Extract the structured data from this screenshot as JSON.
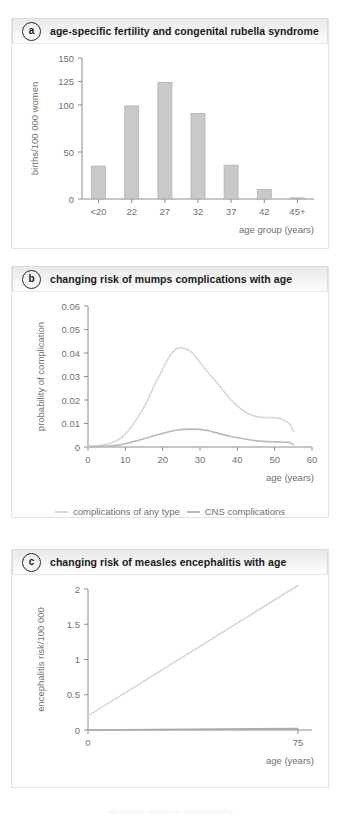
{
  "figure": {
    "footnote": "age-related changes in transmissibility"
  },
  "colors": {
    "bar_fill": "#c9c9c9",
    "bar_stroke": "#b2b2b2",
    "axis": "#8d8e90",
    "tick_text": "#6f7072",
    "curve_any": "#d8d8d8",
    "curve_cns": "#b9babc",
    "line_encephalitis": "#d8d8d8",
    "line_baseline": "#a9aaac",
    "header_text": "#1a1a1a"
  },
  "panels": [
    {
      "letter": "a",
      "title": "age-specific fertility and congenital rubella syndrome"
    },
    {
      "letter": "b",
      "title": "changing risk of mumps complications with age"
    },
    {
      "letter": "c",
      "title": "changing risk of measles encephalitis with age"
    }
  ],
  "legend_b": [
    {
      "label": "complications of any type",
      "color": "#d8d8d8"
    },
    {
      "label": "CNS complications",
      "color": "#b9babc"
    }
  ],
  "chart_data": [
    {
      "type": "bar",
      "panel": "a",
      "title": "age-specific fertility and congenital rubella syndrome",
      "xlabel": "age group (years)",
      "ylabel": "births/100 000 women",
      "categories": [
        "<20",
        "22",
        "27",
        "32",
        "37",
        "42",
        "45+"
      ],
      "values": [
        35,
        99,
        124,
        91,
        36,
        10,
        1
      ],
      "ylim": [
        0,
        150
      ],
      "yticks": [
        0,
        50,
        100,
        125,
        150
      ],
      "ytick_labels": [
        "0",
        "50",
        "100",
        "125",
        "150"
      ],
      "grid": false,
      "legend": "none"
    },
    {
      "type": "line",
      "panel": "b",
      "title": "changing risk of mumps complications with age",
      "xlabel": "age (years)",
      "ylabel": "probability of complication",
      "xlim": [
        0,
        60
      ],
      "ylim": [
        0,
        0.06
      ],
      "xticks": [
        0,
        10,
        20,
        30,
        40,
        50,
        60
      ],
      "xtick_labels": [
        "0",
        "10",
        "20",
        "30",
        "40",
        "50",
        "60"
      ],
      "yticks": [
        0,
        0.01,
        0.02,
        0.03,
        0.04,
        0.05,
        0.06
      ],
      "ytick_labels": [
        "0",
        "0.01",
        "0.02",
        "0.03",
        "0.04",
        "0.05",
        "0.06"
      ],
      "grid": false,
      "legend": "bottom-center",
      "series": [
        {
          "name": "complications of any type",
          "color": "#d8d8d8",
          "x": [
            0,
            5,
            8,
            10,
            12,
            15,
            18,
            20,
            22,
            24,
            26,
            28,
            30,
            32,
            35,
            38,
            40,
            42,
            44,
            46,
            48,
            50,
            52,
            54,
            55
          ],
          "values": [
            0.0002,
            0.0012,
            0.003,
            0.0055,
            0.0095,
            0.017,
            0.027,
            0.033,
            0.039,
            0.042,
            0.0418,
            0.04,
            0.036,
            0.032,
            0.0265,
            0.0205,
            0.0175,
            0.015,
            0.0135,
            0.0127,
            0.0125,
            0.0125,
            0.0118,
            0.0098,
            0.0068
          ]
        },
        {
          "name": "CNS complications",
          "color": "#b9babc",
          "x": [
            0,
            5,
            8,
            10,
            12,
            15,
            18,
            20,
            22,
            24,
            26,
            28,
            30,
            32,
            35,
            38,
            40,
            42,
            44,
            46,
            48,
            50,
            52,
            54,
            55
          ],
          "values": [
            0.0001,
            0.0004,
            0.0008,
            0.0014,
            0.0022,
            0.0035,
            0.005,
            0.0058,
            0.0066,
            0.0072,
            0.0075,
            0.0076,
            0.0075,
            0.007,
            0.0058,
            0.0046,
            0.004,
            0.0034,
            0.0029,
            0.0025,
            0.0023,
            0.0022,
            0.0021,
            0.0019,
            0.001
          ]
        }
      ]
    },
    {
      "type": "line",
      "panel": "c",
      "title": "changing risk of measles encephalitis with age",
      "xlabel": "age (years)",
      "ylabel": "encephalitis risk/100 000",
      "xlim": [
        0,
        80
      ],
      "ylim": [
        0,
        2
      ],
      "xticks": [
        0,
        75
      ],
      "xtick_labels": [
        "0",
        "75"
      ],
      "yticks": [
        0,
        0.5,
        1,
        1.5,
        2
      ],
      "ytick_labels": [
        "0",
        "0.5",
        "1",
        "1.5",
        "2"
      ],
      "grid": false,
      "legend": "none",
      "series": [
        {
          "name": "encephalitis risk",
          "color": "#d8d8d8",
          "x": [
            0,
            75
          ],
          "values": [
            0.2,
            2.05
          ]
        },
        {
          "name": "baseline",
          "color": "#a9aaac",
          "x": [
            0,
            75
          ],
          "values": [
            0.0,
            0.02
          ]
        }
      ]
    }
  ]
}
